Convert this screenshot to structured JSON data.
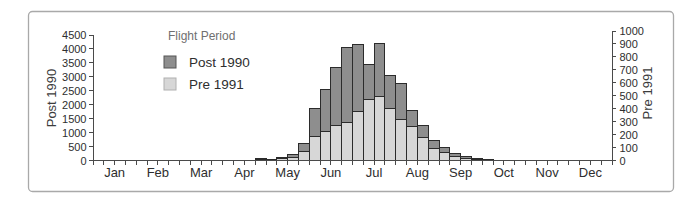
{
  "chart_data": {
    "type": "bar",
    "title": "",
    "legend": {
      "title": "Flight Period",
      "position": "top-left-inside",
      "series": [
        {
          "name": "Post 1990",
          "color": "#8e8e8e",
          "swatch_border": "#555555",
          "axis": "left"
        },
        {
          "name": "Pre 1991",
          "color": "#d7d7d7",
          "swatch_border": "#b0b0b0",
          "axis": "right"
        }
      ]
    },
    "axes": {
      "left": {
        "title": "Post 1990",
        "min": 0,
        "max": 4500,
        "tick_step": 500,
        "ticks": [
          "0",
          "500",
          "1000",
          "1500",
          "2000",
          "2500",
          "3000",
          "3500",
          "4000",
          "4500"
        ]
      },
      "right": {
        "title": "Pre 1991",
        "min": 0,
        "max": 1000,
        "tick_step": 100,
        "ticks": [
          "0",
          "100",
          "200",
          "300",
          "400",
          "500",
          "600",
          "700",
          "800",
          "900",
          "1000"
        ]
      },
      "x": {
        "months": [
          "Jan",
          "Feb",
          "Mar",
          "Apr",
          "May",
          "Jun",
          "Jul",
          "Aug",
          "Sep",
          "Oct",
          "Nov",
          "Dec"
        ],
        "bars_per_month": 4,
        "grid": false
      }
    },
    "bars": [
      {
        "period": "Apr-w4",
        "week_index": 15,
        "post_1990": 60,
        "pre_1991": 8
      },
      {
        "period": "May-w1",
        "week_index": 16,
        "post_1990": 40,
        "pre_1991": 5
      },
      {
        "period": "May-w2",
        "week_index": 17,
        "post_1990": 110,
        "pre_1991": 12
      },
      {
        "period": "May-w3",
        "week_index": 18,
        "post_1990": 230,
        "pre_1991": 25
      },
      {
        "period": "May-w4",
        "week_index": 19,
        "post_1990": 600,
        "pre_1991": 70
      },
      {
        "period": "Jun-w1",
        "week_index": 20,
        "post_1990": 1850,
        "pre_1991": 185
      },
      {
        "period": "Jun-w2",
        "week_index": 21,
        "post_1990": 2550,
        "pre_1991": 225
      },
      {
        "period": "Jun-w3",
        "week_index": 22,
        "post_1990": 3350,
        "pre_1991": 270
      },
      {
        "period": "Jun-w4",
        "week_index": 23,
        "post_1990": 4050,
        "pre_1991": 290
      },
      {
        "period": "Jul-w1",
        "week_index": 24,
        "post_1990": 4150,
        "pre_1991": 375
      },
      {
        "period": "Jul-w2",
        "week_index": 25,
        "post_1990": 3450,
        "pre_1991": 470
      },
      {
        "period": "Jul-w3",
        "week_index": 26,
        "post_1990": 4200,
        "pre_1991": 495
      },
      {
        "period": "Jul-w4",
        "week_index": 27,
        "post_1990": 3050,
        "pre_1991": 405
      },
      {
        "period": "Aug-w1",
        "week_index": 28,
        "post_1990": 2750,
        "pre_1991": 315
      },
      {
        "period": "Aug-w2",
        "week_index": 29,
        "post_1990": 1800,
        "pre_1991": 265
      },
      {
        "period": "Aug-w3",
        "week_index": 30,
        "post_1990": 1250,
        "pre_1991": 175
      },
      {
        "period": "Aug-w4",
        "week_index": 31,
        "post_1990": 700,
        "pre_1991": 90
      },
      {
        "period": "Sep-w1",
        "week_index": 32,
        "post_1990": 480,
        "pre_1991": 65
      },
      {
        "period": "Sep-w2",
        "week_index": 33,
        "post_1990": 265,
        "pre_1991": 30
      },
      {
        "period": "Sep-w3",
        "week_index": 34,
        "post_1990": 140,
        "pre_1991": 12
      },
      {
        "period": "Sep-w4",
        "week_index": 35,
        "post_1990": 85,
        "pre_1991": 8
      },
      {
        "period": "Oct-w1",
        "week_index": 36,
        "post_1990": 35,
        "pre_1991": 3
      }
    ],
    "colors": {
      "bar_outline": "#2b2b2b",
      "axis_line": "#4a4a4a",
      "frame_border": "#a9a9a9",
      "background": "#ffffff"
    }
  }
}
